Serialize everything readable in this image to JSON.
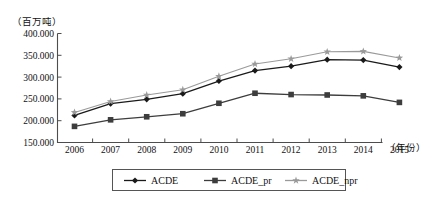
{
  "chart_data": {
    "type": "line",
    "title": "",
    "subtitle": "",
    "xlabel": "（年份）",
    "ylabel": "（百万吨）",
    "categories": [
      "2006",
      "2007",
      "2008",
      "2009",
      "2010",
      "2011",
      "2012",
      "2013",
      "2014",
      "2015"
    ],
    "x": [
      2006,
      2007,
      2008,
      2009,
      2010,
      2011,
      2012,
      2013,
      2014,
      2015
    ],
    "ylim": [
      150,
      400
    ],
    "yticks": [
      150,
      200,
      250,
      300,
      350,
      400
    ],
    "ytick_labels": [
      "150.000",
      "200.000",
      "250.000",
      "300.000",
      "350.000",
      "400.000"
    ],
    "grid": false,
    "legend_position": "bottom",
    "series": [
      {
        "name": "ACDE",
        "marker": "diamond",
        "color": "#1a1a1a",
        "values": [
          212,
          239,
          249,
          262,
          291,
          315,
          325,
          340,
          339,
          323
        ]
      },
      {
        "name": "ACDE_pr",
        "marker": "square",
        "color": "#3d3d3d",
        "values": [
          187,
          202,
          209,
          216,
          240,
          263,
          260,
          259,
          257,
          242
        ]
      },
      {
        "name": "ACDE_npr",
        "marker": "star",
        "color": "#9a9a9a",
        "values": [
          219,
          244,
          259,
          271,
          302,
          330,
          342,
          358,
          359,
          344
        ]
      }
    ]
  },
  "axis": {
    "unit_label": "（百万吨）",
    "x_axis_title": "（年份）",
    "ytick_labels": [
      "400.000",
      "350.000",
      "300.000",
      "250.000",
      "200.000",
      "150.000"
    ],
    "xtick_labels": [
      "2006",
      "2007",
      "2008",
      "2009",
      "2010",
      "2011",
      "2012",
      "2013",
      "2014",
      "2015"
    ]
  },
  "legend": {
    "entries": [
      {
        "label": "ACDE",
        "marker": "diamond-marker-icon",
        "color": "#1a1a1a"
      },
      {
        "label": "ACDE_pr",
        "marker": "square-marker-icon",
        "color": "#3d3d3d"
      },
      {
        "label": "ACDE_npr",
        "marker": "star-marker-icon",
        "color": "#9a9a9a"
      }
    ]
  }
}
